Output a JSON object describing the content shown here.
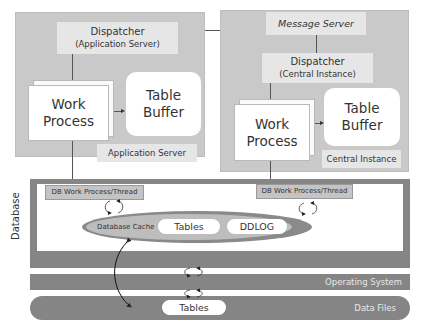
{
  "application_server": {
    "dispatcher": {
      "line1": "Dispatcher",
      "line2": "(Application Server)"
    },
    "work_process": {
      "line1": "Work",
      "line2": "Process"
    },
    "table_buffer": {
      "line1": "Table",
      "line2": "Buffer"
    },
    "label": "Application Server"
  },
  "central_instance": {
    "message_server": "Message Server",
    "dispatcher": {
      "line1": "Dispatcher",
      "line2": "(Central Instance)"
    },
    "work_process": {
      "line1": "Work",
      "line2": "Process"
    },
    "table_buffer": {
      "line1": "Table",
      "line2": "Buffer"
    },
    "label": "Central Instance"
  },
  "database": {
    "label": "Database",
    "db_work_process_left": "DB Work Process/Thread",
    "db_work_process_right": "DB Work Process/Thread",
    "cache": {
      "label": "Database Cache",
      "items": [
        "Tables",
        "DDLOG"
      ]
    }
  },
  "operating_system": {
    "label": "Operating System"
  },
  "data_files": {
    "label": "Data Files",
    "tables_label": "Tables"
  },
  "colors": {
    "panel": "#c9c9c9",
    "light_box": "#e6e6e6",
    "dark_bar": "#858585",
    "cache_ring": "#8a8a8a",
    "cache_fill": "#bdbdbd"
  }
}
